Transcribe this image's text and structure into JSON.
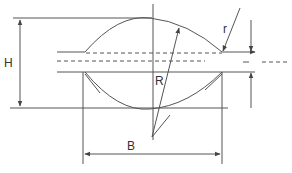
{
  "diagram": {
    "labels": {
      "height": "H",
      "width": "B",
      "large_radius": "R",
      "small_radius": "r"
    },
    "colors": {
      "line": "#555555",
      "background": "#ffffff"
    }
  }
}
